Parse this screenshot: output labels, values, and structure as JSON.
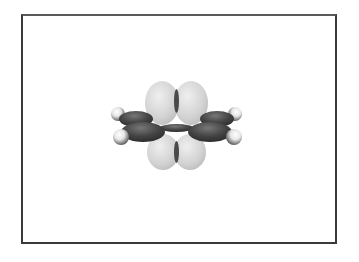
{
  "figure": {
    "colors": {
      "frame_border": "#3a3a3a",
      "pi_lobe": "#d4d4d4",
      "pi_lobe_highlight": "#ececec",
      "sigma_lobe": "#3c3c3c",
      "sigma_lobe_highlight": "#6a6a6a",
      "hydrogen": "#f4f4f4",
      "hydrogen_shadow": "#5a5a5a",
      "background": "#ffffff"
    },
    "atoms": [
      {
        "element": "H",
        "x": 118,
        "y": 114,
        "r": 7
      },
      {
        "element": "H",
        "x": 121,
        "y": 137,
        "r": 8
      },
      {
        "element": "H",
        "x": 235,
        "y": 114,
        "r": 7
      },
      {
        "element": "H",
        "x": 234,
        "y": 137,
        "r": 8
      }
    ]
  }
}
